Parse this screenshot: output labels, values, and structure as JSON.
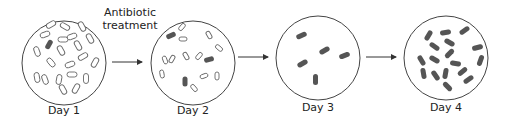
{
  "diagram": {
    "annotation": {
      "line1": "Antibiotic",
      "line2": "treatment"
    },
    "stages": [
      {
        "label": "Day 1",
        "description": "Many susceptible (open) bacteria, one resistant (filled)"
      },
      {
        "label": "Day 2",
        "description": "Fewer susceptible bacteria, three resistant"
      },
      {
        "label": "Day 3",
        "description": "Only five resistant bacteria remain"
      },
      {
        "label": "Day 4",
        "description": "Population of resistant bacteria has multiplied"
      }
    ],
    "legend_colors": {
      "susceptible": "#ffffff",
      "resistant": "#555555",
      "outline": "#444444"
    }
  }
}
